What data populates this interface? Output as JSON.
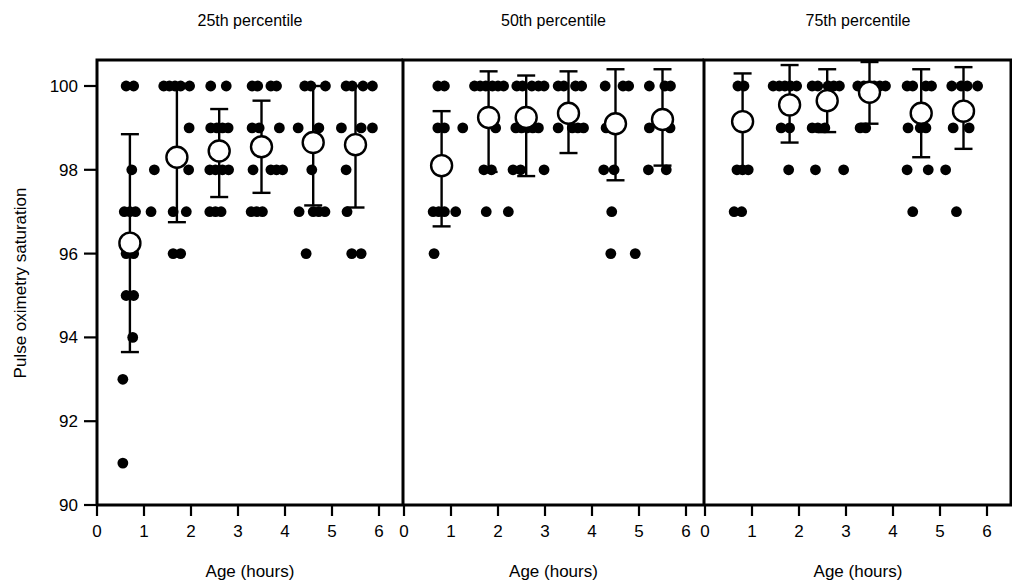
{
  "figure": {
    "y_axis_title": "Pulse oximetry saturation",
    "x_axis_titles": [
      "Age (hours)",
      "Age (hours)",
      "Age (hours)"
    ],
    "panel_titles": [
      "25th percentile",
      "50th percentile",
      "75th percentile"
    ],
    "y_ticks": [
      "90",
      "92",
      "94",
      "96",
      "98",
      "100"
    ],
    "x_ticks": [
      "0",
      "1",
      "2",
      "3",
      "4",
      "5",
      "6"
    ],
    "colors": {
      "axis": "#000000",
      "point": "#000000",
      "mean_fill": "#ffffff",
      "background": "#ffffff"
    }
  },
  "chart_data": {
    "type": "scatter",
    "title": "",
    "subtitle": "",
    "xlabel": "Age (hours)",
    "ylabel": "Pulse oximetry saturation",
    "xlim": [
      0,
      6.5
    ],
    "ylim": [
      90,
      100.6
    ],
    "grid": false,
    "legend": "none",
    "xticks": [
      0,
      1,
      2,
      3,
      4,
      5,
      6
    ],
    "yticks": [
      90,
      92,
      94,
      96,
      98,
      100
    ],
    "panels": [
      {
        "name": "25th percentile",
        "summary": {
          "x": [
            0.7,
            1.7,
            2.6,
            3.5,
            4.6,
            5.5
          ],
          "mean": [
            96.25,
            98.3,
            98.45,
            98.55,
            98.65,
            98.6
          ],
          "ci_low": [
            93.65,
            96.75,
            97.35,
            97.45,
            97.15,
            97.1
          ],
          "ci_high": [
            98.85,
            100.0,
            99.45,
            99.65,
            100.0,
            100.0
          ]
        },
        "points": [
          {
            "x": 0.62,
            "y": 100
          },
          {
            "x": 0.78,
            "y": 100
          },
          {
            "x": 1.42,
            "y": 100
          },
          {
            "x": 1.54,
            "y": 100
          },
          {
            "x": 1.66,
            "y": 100
          },
          {
            "x": 1.78,
            "y": 100
          },
          {
            "x": 1.97,
            "y": 100
          },
          {
            "x": 2.42,
            "y": 100
          },
          {
            "x": 2.75,
            "y": 100
          },
          {
            "x": 3.3,
            "y": 100
          },
          {
            "x": 3.42,
            "y": 100
          },
          {
            "x": 3.7,
            "y": 100
          },
          {
            "x": 3.82,
            "y": 100
          },
          {
            "x": 4.42,
            "y": 100
          },
          {
            "x": 4.55,
            "y": 100
          },
          {
            "x": 4.86,
            "y": 100
          },
          {
            "x": 5.3,
            "y": 100
          },
          {
            "x": 5.43,
            "y": 100
          },
          {
            "x": 5.66,
            "y": 100
          },
          {
            "x": 5.86,
            "y": 100
          },
          {
            "x": 1.96,
            "y": 99
          },
          {
            "x": 2.42,
            "y": 99
          },
          {
            "x": 2.55,
            "y": 99
          },
          {
            "x": 2.67,
            "y": 99
          },
          {
            "x": 2.79,
            "y": 99
          },
          {
            "x": 3.3,
            "y": 99
          },
          {
            "x": 3.45,
            "y": 99
          },
          {
            "x": 3.88,
            "y": 99
          },
          {
            "x": 4.28,
            "y": 99
          },
          {
            "x": 4.72,
            "y": 99
          },
          {
            "x": 5.2,
            "y": 99
          },
          {
            "x": 5.62,
            "y": 99
          },
          {
            "x": 5.86,
            "y": 99
          },
          {
            "x": 0.74,
            "y": 98
          },
          {
            "x": 1.22,
            "y": 98
          },
          {
            "x": 1.95,
            "y": 98
          },
          {
            "x": 2.4,
            "y": 98
          },
          {
            "x": 2.52,
            "y": 98
          },
          {
            "x": 2.67,
            "y": 98
          },
          {
            "x": 2.8,
            "y": 98
          },
          {
            "x": 3.32,
            "y": 98
          },
          {
            "x": 3.7,
            "y": 98
          },
          {
            "x": 3.82,
            "y": 98
          },
          {
            "x": 3.95,
            "y": 98
          },
          {
            "x": 4.57,
            "y": 98
          },
          {
            "x": 5.3,
            "y": 98
          },
          {
            "x": 0.58,
            "y": 97
          },
          {
            "x": 0.7,
            "y": 97
          },
          {
            "x": 0.82,
            "y": 97
          },
          {
            "x": 1.15,
            "y": 97
          },
          {
            "x": 1.62,
            "y": 97
          },
          {
            "x": 1.9,
            "y": 97
          },
          {
            "x": 2.4,
            "y": 97
          },
          {
            "x": 2.52,
            "y": 97
          },
          {
            "x": 2.64,
            "y": 97
          },
          {
            "x": 3.28,
            "y": 97
          },
          {
            "x": 3.4,
            "y": 97
          },
          {
            "x": 3.52,
            "y": 97
          },
          {
            "x": 4.3,
            "y": 97
          },
          {
            "x": 4.6,
            "y": 97
          },
          {
            "x": 4.72,
            "y": 97
          },
          {
            "x": 4.85,
            "y": 97
          },
          {
            "x": 5.32,
            "y": 97
          },
          {
            "x": 0.62,
            "y": 96
          },
          {
            "x": 0.78,
            "y": 96
          },
          {
            "x": 1.62,
            "y": 96
          },
          {
            "x": 1.78,
            "y": 96
          },
          {
            "x": 4.45,
            "y": 96
          },
          {
            "x": 5.42,
            "y": 96
          },
          {
            "x": 5.62,
            "y": 96
          },
          {
            "x": 0.62,
            "y": 95
          },
          {
            "x": 0.78,
            "y": 95
          },
          {
            "x": 0.76,
            "y": 94
          },
          {
            "x": 0.55,
            "y": 93
          },
          {
            "x": 0.55,
            "y": 91
          }
        ]
      },
      {
        "name": "50th percentile",
        "summary": {
          "x": [
            0.8,
            1.8,
            2.6,
            3.5,
            4.5,
            5.5
          ],
          "mean": [
            98.1,
            99.25,
            99.25,
            99.35,
            99.1,
            99.2
          ],
          "ci_low": [
            96.65,
            97.95,
            97.85,
            98.4,
            97.75,
            98.1
          ],
          "ci_high": [
            99.4,
            100.35,
            100.25,
            100.35,
            100.4,
            100.4
          ]
        },
        "points": [
          {
            "x": 0.72,
            "y": 100
          },
          {
            "x": 0.86,
            "y": 100
          },
          {
            "x": 1.5,
            "y": 100
          },
          {
            "x": 1.62,
            "y": 100
          },
          {
            "x": 1.74,
            "y": 100
          },
          {
            "x": 1.88,
            "y": 100
          },
          {
            "x": 2.0,
            "y": 100
          },
          {
            "x": 2.12,
            "y": 100
          },
          {
            "x": 2.4,
            "y": 100
          },
          {
            "x": 2.52,
            "y": 100
          },
          {
            "x": 2.72,
            "y": 100
          },
          {
            "x": 2.86,
            "y": 100
          },
          {
            "x": 2.98,
            "y": 100
          },
          {
            "x": 3.28,
            "y": 100
          },
          {
            "x": 3.4,
            "y": 100
          },
          {
            "x": 3.65,
            "y": 100
          },
          {
            "x": 3.78,
            "y": 100
          },
          {
            "x": 4.28,
            "y": 100
          },
          {
            "x": 4.66,
            "y": 100
          },
          {
            "x": 4.78,
            "y": 100
          },
          {
            "x": 5.22,
            "y": 100
          },
          {
            "x": 5.55,
            "y": 100
          },
          {
            "x": 5.67,
            "y": 100
          },
          {
            "x": 0.72,
            "y": 99
          },
          {
            "x": 0.86,
            "y": 99
          },
          {
            "x": 1.25,
            "y": 99
          },
          {
            "x": 1.95,
            "y": 99
          },
          {
            "x": 2.38,
            "y": 99
          },
          {
            "x": 2.5,
            "y": 99
          },
          {
            "x": 2.62,
            "y": 99
          },
          {
            "x": 2.74,
            "y": 99
          },
          {
            "x": 2.86,
            "y": 99
          },
          {
            "x": 3.28,
            "y": 99
          },
          {
            "x": 3.58,
            "y": 99
          },
          {
            "x": 3.7,
            "y": 99
          },
          {
            "x": 3.82,
            "y": 99
          },
          {
            "x": 4.3,
            "y": 99
          },
          {
            "x": 5.22,
            "y": 99
          },
          {
            "x": 5.66,
            "y": 99
          },
          {
            "x": 0.74,
            "y": 98
          },
          {
            "x": 0.87,
            "y": 98
          },
          {
            "x": 1.7,
            "y": 98
          },
          {
            "x": 1.86,
            "y": 98
          },
          {
            "x": 2.32,
            "y": 98
          },
          {
            "x": 2.48,
            "y": 98
          },
          {
            "x": 2.98,
            "y": 98
          },
          {
            "x": 4.25,
            "y": 98
          },
          {
            "x": 4.47,
            "y": 98
          },
          {
            "x": 5.2,
            "y": 98
          },
          {
            "x": 5.58,
            "y": 98
          },
          {
            "x": 0.62,
            "y": 97
          },
          {
            "x": 0.74,
            "y": 97
          },
          {
            "x": 0.86,
            "y": 97
          },
          {
            "x": 1.1,
            "y": 97
          },
          {
            "x": 1.75,
            "y": 97
          },
          {
            "x": 2.22,
            "y": 97
          },
          {
            "x": 4.42,
            "y": 97
          },
          {
            "x": 0.64,
            "y": 96
          },
          {
            "x": 4.4,
            "y": 96
          },
          {
            "x": 4.92,
            "y": 96
          }
        ]
      },
      {
        "name": "75th percentile",
        "summary": {
          "x": [
            0.8,
            1.8,
            2.6,
            3.5,
            4.6,
            5.5
          ],
          "mean": [
            99.15,
            99.55,
            99.65,
            99.85,
            99.35,
            99.4
          ],
          "ci_low": [
            98.0,
            98.65,
            98.9,
            99.1,
            98.3,
            98.5
          ],
          "ci_high": [
            100.3,
            100.5,
            100.4,
            100.6,
            100.4,
            100.45
          ]
        },
        "points": [
          {
            "x": 0.7,
            "y": 100
          },
          {
            "x": 0.83,
            "y": 100
          },
          {
            "x": 1.45,
            "y": 100
          },
          {
            "x": 1.58,
            "y": 100
          },
          {
            "x": 1.7,
            "y": 100
          },
          {
            "x": 1.82,
            "y": 100
          },
          {
            "x": 1.95,
            "y": 100
          },
          {
            "x": 2.28,
            "y": 100
          },
          {
            "x": 2.4,
            "y": 100
          },
          {
            "x": 2.62,
            "y": 100
          },
          {
            "x": 2.74,
            "y": 100
          },
          {
            "x": 2.86,
            "y": 100
          },
          {
            "x": 3.25,
            "y": 100
          },
          {
            "x": 3.38,
            "y": 100
          },
          {
            "x": 3.6,
            "y": 100
          },
          {
            "x": 3.72,
            "y": 100
          },
          {
            "x": 3.84,
            "y": 100
          },
          {
            "x": 4.3,
            "y": 100
          },
          {
            "x": 4.42,
            "y": 100
          },
          {
            "x": 4.7,
            "y": 100
          },
          {
            "x": 4.82,
            "y": 100
          },
          {
            "x": 5.25,
            "y": 100
          },
          {
            "x": 5.45,
            "y": 100
          },
          {
            "x": 5.58,
            "y": 100
          },
          {
            "x": 5.8,
            "y": 100
          },
          {
            "x": 1.62,
            "y": 99
          },
          {
            "x": 1.8,
            "y": 99
          },
          {
            "x": 2.28,
            "y": 99
          },
          {
            "x": 2.4,
            "y": 99
          },
          {
            "x": 2.55,
            "y": 99
          },
          {
            "x": 3.3,
            "y": 99
          },
          {
            "x": 3.42,
            "y": 99
          },
          {
            "x": 4.32,
            "y": 99
          },
          {
            "x": 4.58,
            "y": 99
          },
          {
            "x": 4.7,
            "y": 99
          },
          {
            "x": 5.28,
            "y": 99
          },
          {
            "x": 5.62,
            "y": 99
          },
          {
            "x": 0.68,
            "y": 98
          },
          {
            "x": 0.8,
            "y": 98
          },
          {
            "x": 0.92,
            "y": 98
          },
          {
            "x": 1.78,
            "y": 98
          },
          {
            "x": 2.35,
            "y": 98
          },
          {
            "x": 2.95,
            "y": 98
          },
          {
            "x": 4.3,
            "y": 98
          },
          {
            "x": 4.75,
            "y": 98
          },
          {
            "x": 5.12,
            "y": 98
          },
          {
            "x": 0.62,
            "y": 97
          },
          {
            "x": 0.78,
            "y": 97
          },
          {
            "x": 4.42,
            "y": 97
          },
          {
            "x": 5.35,
            "y": 97
          }
        ]
      }
    ]
  }
}
